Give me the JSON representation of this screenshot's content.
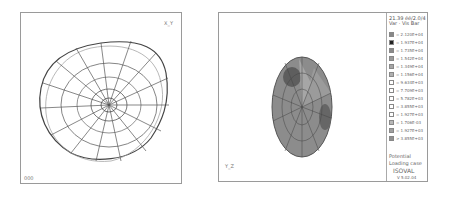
{
  "left_view": {
    "title": "deformed-shape wireframe",
    "axis_label": "X_Y",
    "corner_text": "000"
  },
  "right_view": {
    "axis_label": "Y_Z",
    "legend": {
      "header": [
        "21.39 éé/2.0/4",
        "Var · Vis Bar"
      ],
      "entries": [
        {
          "color": "#888888",
          "value": "= 2.120E+04"
        },
        {
          "color": "#222222",
          "value": "= 1.937E+04"
        },
        {
          "color": "#8a8a8a",
          "value": "= 1.735E+04"
        },
        {
          "color": "#9a9a9a",
          "value": "= 1.542E+04"
        },
        {
          "color": "#a6a6a6",
          "value": "= 1.349E+04"
        },
        {
          "color": "#b0b0b0",
          "value": "= 1.156E+04"
        },
        {
          "color": "#ffffff",
          "value": "= 9.634E+03"
        },
        {
          "color": "#ffffff",
          "value": "= 7.709E+03"
        },
        {
          "color": "#ffffff",
          "value": "= 5.782E+03"
        },
        {
          "color": "#ffffff",
          "value": "= 3.855E+03"
        },
        {
          "color": "#ffffff",
          "value": "= 1.927E+03"
        },
        {
          "color": "#b8b8b8",
          "value": "= 1.706E-03"
        },
        {
          "color": "#a0a0a0",
          "value": "= 1.927E+03"
        },
        {
          "color": "#909090",
          "value": "> 3.855E+03"
        }
      ],
      "last_sub": "< 5.782E+03",
      "footer": [
        "Potential",
        "Loading case",
        "ISOVAL",
        "V 5.02.04"
      ]
    }
  }
}
